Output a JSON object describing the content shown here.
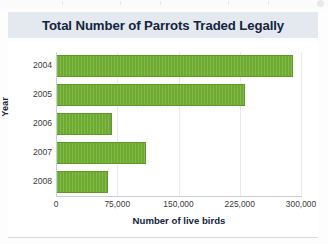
{
  "chart_data": {
    "type": "bar",
    "orientation": "horizontal",
    "title": "Total Number of Parrots Traded Legally",
    "xlabel": "Number of live birds",
    "ylabel": "Year",
    "categories": [
      "2004",
      "2005",
      "2006",
      "2007",
      "2008"
    ],
    "values": [
      290000,
      232000,
      69000,
      110000,
      64000
    ],
    "xlim": [
      0,
      300000
    ],
    "xticks": [
      0,
      75000,
      150000,
      225000,
      300000
    ],
    "xtick_labels": [
      "0",
      "75,000",
      "150,000",
      "225,000",
      "300,000"
    ],
    "grid": "vertical",
    "legend": "none",
    "bar_color": "#6cab2e",
    "title_band_color": "#e4e9ef",
    "title_text_color": "#14243c"
  }
}
